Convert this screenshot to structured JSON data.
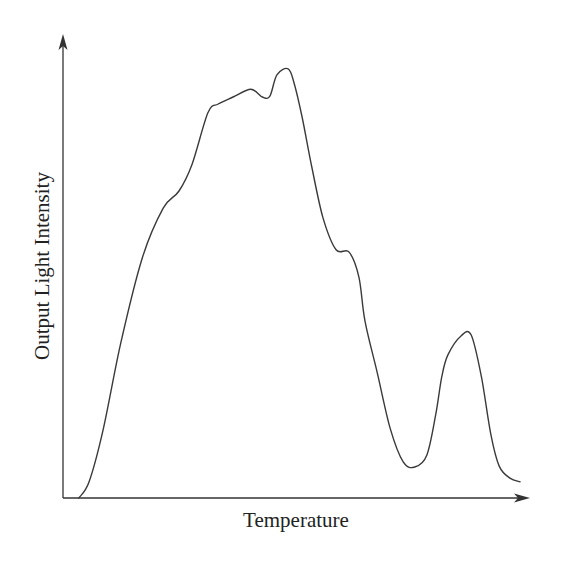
{
  "chart_data": {
    "type": "line",
    "title": "",
    "xlabel": "Temperature",
    "ylabel": "Output Light Intensity",
    "x_units": "arbitrary (normalized 0-100, no ticks shown)",
    "y_units": "arbitrary (normalized 0-100, no ticks shown)",
    "xlim": [
      0,
      100
    ],
    "ylim": [
      0,
      100
    ],
    "grid": false,
    "legend": null,
    "ticks_shown": false,
    "axes_style": "arrowheads on x and y axes",
    "series": [
      {
        "name": "glow curve",
        "color": "#3a3a3a",
        "x": [
          3.4,
          5.6,
          8.6,
          12.4,
          17.0,
          21.5,
          24.9,
          27.7,
          31.1,
          33.3,
          36.5,
          40.3,
          42.8,
          44.4,
          45.9,
          48.3,
          49.6,
          51.3,
          53.4,
          55.8,
          58.6,
          61.4,
          63.5,
          64.8,
          67.4,
          70.2,
          73.0,
          75.5,
          78.1,
          80.0,
          81.3,
          82.6,
          85.4,
          87.6,
          89.8,
          91.8,
          93.6,
          95.9,
          98.1
        ],
        "y": [
          0.0,
          3.5,
          14.7,
          33.5,
          51.8,
          62.6,
          66.3,
          72.1,
          83.2,
          85.1,
          86.6,
          88.3,
          86.6,
          86.8,
          91.4,
          92.7,
          89.6,
          82.3,
          71.5,
          60.5,
          53.6,
          53.1,
          47.7,
          38.2,
          27.2,
          15.1,
          7.8,
          6.7,
          9.3,
          18.1,
          26.3,
          30.9,
          35.0,
          35.2,
          26.1,
          13.8,
          6.9,
          4.3,
          3.5
        ]
      }
    ],
    "features": [
      {
        "label": "main peak",
        "x": 49.6,
        "y": 92.7
      },
      {
        "label": "shoulder (rising)",
        "x": 27.7,
        "y": 72.1
      },
      {
        "label": "notch near main peak",
        "x": 42.8,
        "y": 86.6
      },
      {
        "label": "shoulder (falling)",
        "x": 51.3,
        "y": 82.3
      },
      {
        "label": "valley",
        "x": 67.4,
        "y": 6.9
      },
      {
        "label": "secondary peak",
        "x": 78.1,
        "y": 35.0
      }
    ]
  },
  "axes": {
    "x_label": "Temperature",
    "y_label": "Output Light Intensity"
  }
}
